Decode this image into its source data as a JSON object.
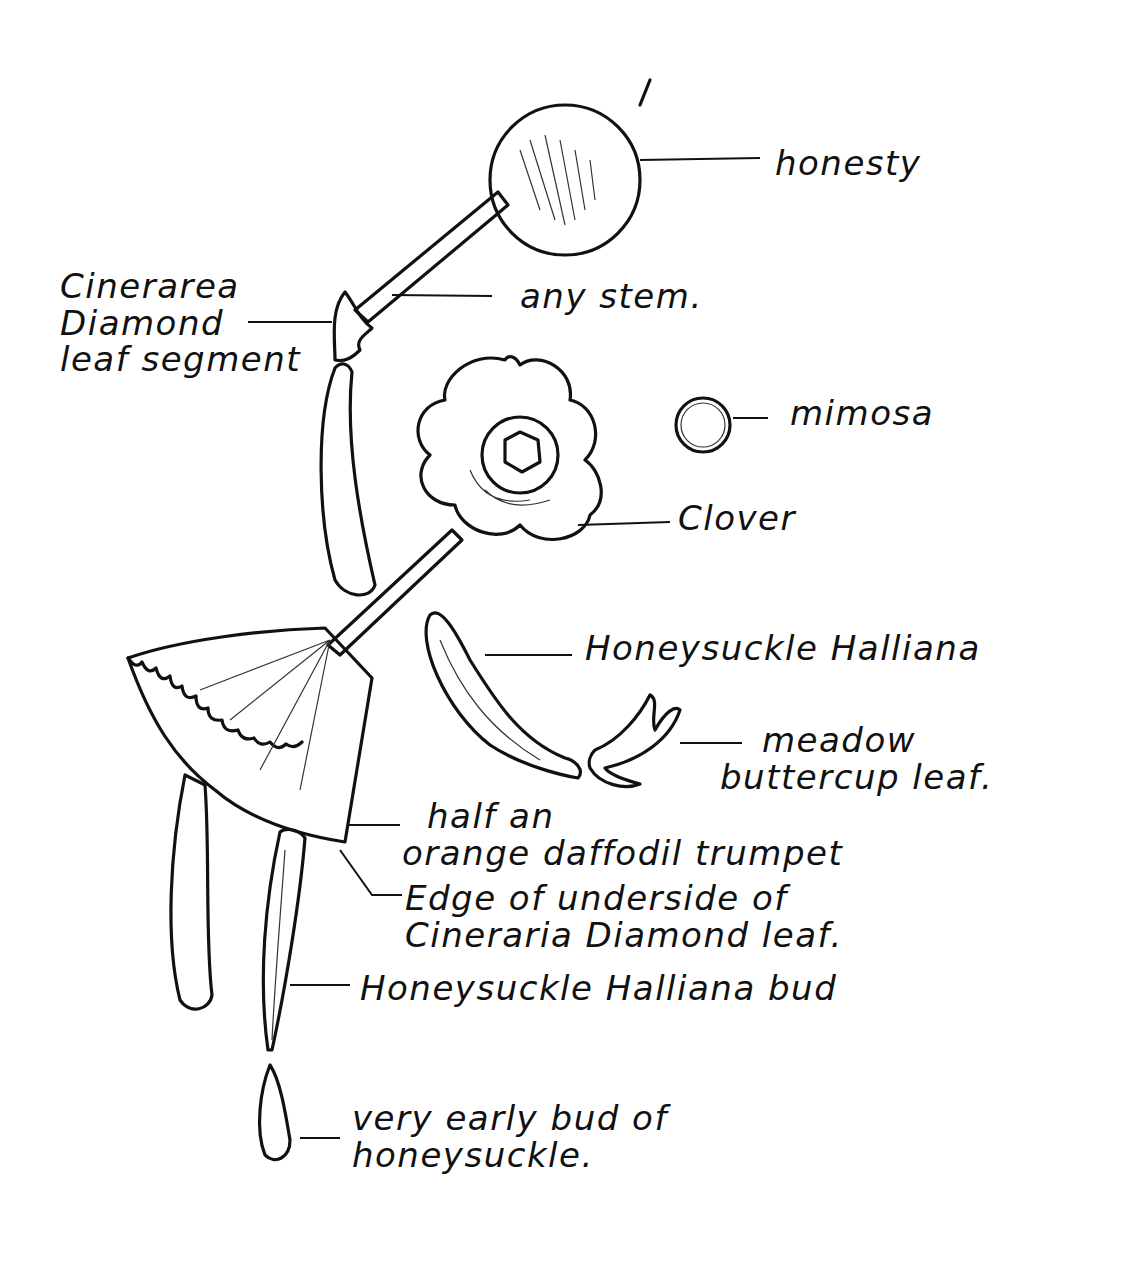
{
  "diagram": {
    "title": "",
    "style": "hand-drawn pen sketch of a figure assembled from plant parts",
    "ink_color": "#111111",
    "background": "#ffffff",
    "labels": [
      {
        "id": "honesty",
        "text": "honesty"
      },
      {
        "id": "any-stem",
        "text": "any stem."
      },
      {
        "id": "cinerarea-leaf-segment",
        "lines": [
          "Cinerarea",
          "Diamond",
          "leaf segment"
        ]
      },
      {
        "id": "mimosa",
        "text": "mimosa"
      },
      {
        "id": "clover",
        "text": "Clover"
      },
      {
        "id": "honeysuckle-halliana",
        "text": "Honeysuckle Halliana"
      },
      {
        "id": "meadow-buttercup-leaf",
        "lines": [
          "meadow",
          "buttercup leaf."
        ]
      },
      {
        "id": "daffodil-trumpet",
        "lines": [
          "half an",
          "orange daffodil trumpet"
        ]
      },
      {
        "id": "cineraria-underside",
        "lines": [
          "Edge of underside of",
          "Cineraria Diamond leaf."
        ]
      },
      {
        "id": "honeysuckle-bud",
        "text": "Honeysuckle Halliana bud"
      },
      {
        "id": "early-bud",
        "lines": [
          "very early bud of",
          "honeysuckle."
        ]
      }
    ]
  }
}
